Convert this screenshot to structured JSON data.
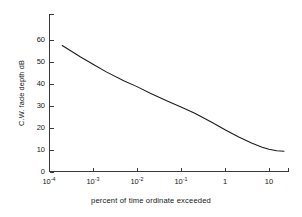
{
  "chart_data": {
    "type": "line",
    "title": "",
    "subtitle": "",
    "xlabel": "percent of time ordinate exceeded",
    "ylabel": "C.W. fade depth dB",
    "xscale": "log",
    "yscale": "linear",
    "xlim": [
      0.0001,
      25
    ],
    "ylim": [
      0,
      67
    ],
    "xticks": [
      0.0001,
      0.001,
      0.01,
      0.1,
      1,
      10
    ],
    "xtick_labels": [
      "10-4",
      "10-3",
      "10-2",
      "10-1",
      "1",
      "10"
    ],
    "xtick_mantissa": [
      "10",
      "10",
      "10",
      "10",
      "1",
      "10"
    ],
    "xtick_exponent": [
      "-4",
      "-3",
      "-2",
      "-1",
      "",
      ""
    ],
    "yticks": [
      0,
      10,
      20,
      30,
      40,
      50,
      60
    ],
    "ytick_labels": [
      "0",
      "10",
      "20",
      "30",
      "40",
      "50",
      "60"
    ],
    "grid": false,
    "legend": false,
    "legend_position": "none",
    "series": [
      {
        "name": "C.W. fade depth",
        "x": [
          0.0002,
          0.0005,
          0.001,
          0.002,
          0.005,
          0.01,
          0.02,
          0.05,
          0.1,
          0.2,
          0.5,
          1,
          2,
          4,
          7,
          10,
          15,
          22
        ],
        "y": [
          57.5,
          52.5,
          49.0,
          45.5,
          41.5,
          38.8,
          35.8,
          32.2,
          29.5,
          26.8,
          22.6,
          19.2,
          16.0,
          13.2,
          11.2,
          10.3,
          9.7,
          9.4
        ]
      }
    ],
    "annotations": [],
    "line_color": "#1a1a1a",
    "axis_color": "#3a3a3a"
  },
  "colors": {
    "background": "#ffffff",
    "axis": "#3a3a3a",
    "curve": "#1a1a1a",
    "text": "#161616"
  },
  "geometry": {
    "origin_x": 49,
    "origin_y": 172,
    "plot_right": 289,
    "plot_top": 14,
    "decade_px": 44,
    "db_px": 2.2
  }
}
